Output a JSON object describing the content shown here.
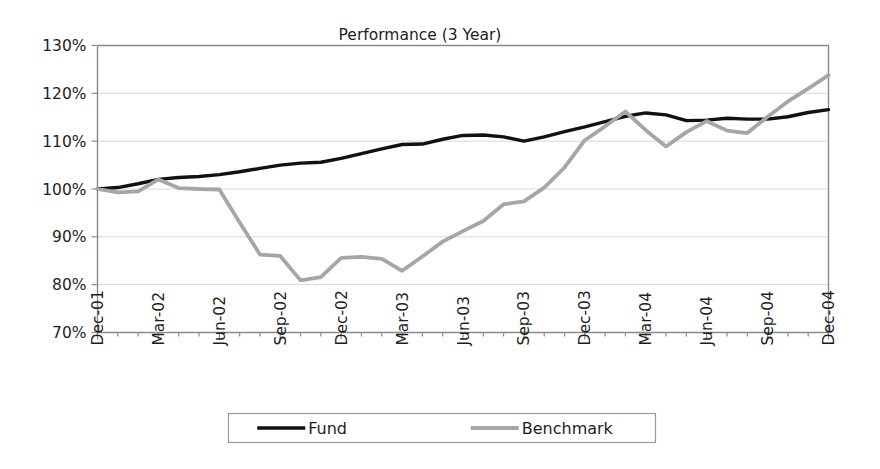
{
  "chart_data": {
    "type": "line",
    "title": "Performance (3 Year)",
    "xlabel": "",
    "ylabel": "",
    "ylim": [
      70,
      130
    ],
    "ytick_values": [
      70,
      80,
      90,
      100,
      110,
      120,
      130
    ],
    "ytick_labels": [
      "70%",
      "80%",
      "90%",
      "100%",
      "110%",
      "120%",
      "130%"
    ],
    "grid": true,
    "legend_position": "bottom",
    "x": [
      "Dec-01",
      "Jan-02",
      "Feb-02",
      "Mar-02",
      "Apr-02",
      "May-02",
      "Jun-02",
      "Jul-02",
      "Aug-02",
      "Sep-02",
      "Oct-02",
      "Nov-02",
      "Dec-02",
      "Jan-03",
      "Feb-03",
      "Mar-03",
      "Apr-03",
      "May-03",
      "Jun-03",
      "Jul-03",
      "Aug-03",
      "Sep-03",
      "Oct-03",
      "Nov-03",
      "Dec-03",
      "Jan-04",
      "Feb-04",
      "Mar-04",
      "Apr-04",
      "May-04",
      "Jun-04",
      "Jul-04",
      "Aug-04",
      "Sep-04",
      "Oct-04",
      "Nov-04",
      "Dec-04"
    ],
    "xtick_labels": [
      "Dec-01",
      "Mar-02",
      "Jun-02",
      "Sep-02",
      "Dec-02",
      "Mar-03",
      "Jun-03",
      "Sep-03",
      "Dec-03",
      "Mar-04",
      "Jun-04",
      "Sep-04",
      "Dec-04"
    ],
    "xtick_indices": [
      0,
      3,
      6,
      9,
      12,
      15,
      18,
      21,
      24,
      27,
      30,
      33,
      36
    ],
    "series": [
      {
        "name": "Fund",
        "color": "#111111",
        "width": 3.4,
        "values": [
          100.0,
          100.3,
          101.1,
          102.0,
          102.4,
          102.6,
          103.0,
          103.6,
          104.3,
          105.0,
          105.4,
          105.6,
          106.4,
          107.4,
          108.4,
          109.3,
          109.4,
          110.4,
          111.2,
          111.3,
          110.9,
          110.0,
          110.9,
          112.0,
          113.0,
          114.1,
          115.2,
          115.9,
          115.5,
          114.3,
          114.4,
          114.8,
          114.6,
          114.6,
          115.1,
          116.0,
          116.6
        ]
      },
      {
        "name": "Benchmark",
        "color": "#a6a6a6",
        "width": 3.8,
        "values": [
          100.0,
          99.3,
          99.5,
          102.0,
          100.2,
          100.0,
          99.9,
          93.0,
          86.3,
          86.0,
          80.9,
          81.6,
          85.6,
          85.8,
          85.4,
          82.9,
          85.9,
          89.0,
          91.2,
          93.3,
          96.8,
          97.4,
          100.3,
          104.5,
          110.2,
          113.1,
          116.2,
          112.3,
          108.9,
          111.9,
          114.2,
          112.2,
          111.7,
          115.1,
          118.3,
          121.0,
          123.8
        ]
      }
    ],
    "legend": [
      {
        "label": "Fund",
        "color": "#111111"
      },
      {
        "label": "Benchmark",
        "color": "#a6a6a6"
      }
    ]
  }
}
